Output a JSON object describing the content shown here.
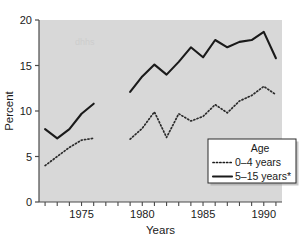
{
  "chart_data": {
    "type": "line",
    "title": "",
    "xlabel": "Years",
    "ylabel": "Percent",
    "xlim": [
      1971.5,
      1991.5
    ],
    "ylim": [
      0,
      20
    ],
    "ytick_labels": [
      "0",
      "5",
      "10",
      "15",
      "20"
    ],
    "ytick_values": [
      0,
      5,
      10,
      15,
      20
    ],
    "xtick_labels": [
      "1975",
      "1980",
      "1985",
      "1990"
    ],
    "xtick_values": [
      1975,
      1980,
      1985,
      1990
    ],
    "xtick_minor_values": [
      1972,
      1973,
      1974,
      1976,
      1977,
      1978,
      1979,
      1981,
      1982,
      1983,
      1984,
      1986,
      1987,
      1988,
      1989,
      1991
    ],
    "grid": false,
    "plot_background": "#d8d8d8",
    "legend_position": "lower right",
    "legend_title": "Age",
    "series": [
      {
        "name": "0-4 years",
        "label": "0–4 years",
        "style": "dotted",
        "color": "#2b2b2b",
        "segments": [
          {
            "x": [
              1972,
              1973,
              1974,
              1975,
              1976
            ],
            "y": [
              4.0,
              5.0,
              6.0,
              6.8,
              7.0
            ]
          },
          {
            "x": [
              1979,
              1980,
              1981,
              1982,
              1983,
              1984,
              1985,
              1986,
              1987,
              1988,
              1989,
              1990,
              1991
            ],
            "y": [
              6.9,
              8.1,
              9.9,
              7.1,
              9.7,
              8.9,
              9.4,
              10.7,
              9.8,
              11.1,
              11.7,
              12.7,
              11.8
            ]
          }
        ]
      },
      {
        "name": "5-15 years",
        "label": "5–15 years*",
        "style": "solid",
        "color": "#1a1a1a",
        "segments": [
          {
            "x": [
              1972,
              1973,
              1974,
              1975,
              1976
            ],
            "y": [
              8.0,
              7.0,
              8.0,
              9.7,
              10.8
            ]
          },
          {
            "x": [
              1979,
              1980,
              1981,
              1982,
              1983,
              1984,
              1985,
              1986,
              1987,
              1988,
              1989,
              1990,
              1991
            ],
            "y": [
              12.1,
              13.8,
              15.1,
              14.0,
              15.4,
              17.0,
              15.9,
              17.8,
              17.0,
              17.6,
              17.8,
              18.7,
              15.8
            ]
          }
        ]
      }
    ]
  },
  "figure": {
    "y_axis_title": "Percent",
    "x_axis_title": "Years",
    "caption": ""
  },
  "legend": {
    "title": "Age",
    "entries": [
      {
        "label": "0–4 years",
        "style": "dotted"
      },
      {
        "label": "5–15 years*",
        "style": "solid"
      }
    ]
  }
}
